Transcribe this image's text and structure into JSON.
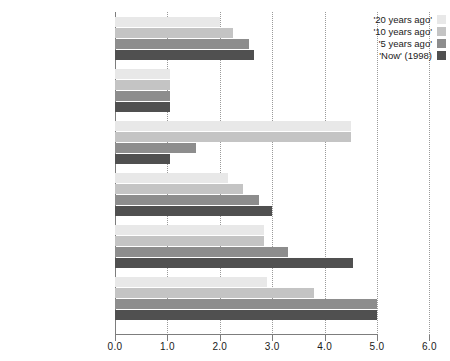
{
  "chart_data": {
    "type": "bar",
    "orientation": "horizontal",
    "title": "",
    "xlabel": "",
    "ylabel": "",
    "xlim": [
      0.0,
      6.0
    ],
    "xticks": [
      "0.0",
      "1.0",
      "2.0",
      "3.0",
      "4.0",
      "5.0",
      "6.0"
    ],
    "xtick_values": [
      0,
      1,
      2,
      3,
      4,
      5,
      6
    ],
    "grid": true,
    "legend_position": "top-right",
    "categories": [
      "Africa (20)",
      "Botswana / Mauritius /\nNamibia / Tunisia",
      "Eritrea",
      "Uganda",
      "Nigeria",
      "Kenya"
    ],
    "series": [
      {
        "name": "'20 years ago'",
        "color": "#e8e8e8",
        "values": [
          2.0,
          1.05,
          4.5,
          2.15,
          2.85,
          2.9
        ]
      },
      {
        "name": "'10 years ago'",
        "color": "#c4c4c4",
        "values": [
          2.25,
          1.05,
          4.5,
          2.45,
          2.85,
          3.8
        ]
      },
      {
        "name": "'5 years ago'",
        "color": "#8d8d8d",
        "values": [
          2.55,
          1.05,
          1.55,
          2.75,
          3.3,
          5.0
        ]
      },
      {
        "name": "'Now' (1998)",
        "color": "#505050",
        "values": [
          2.65,
          1.05,
          1.05,
          3.0,
          4.55,
          5.0
        ]
      }
    ]
  },
  "legend": {
    "items": [
      {
        "label": "'20 years ago'",
        "color": "#e8e8e8"
      },
      {
        "label": "'10 years ago'",
        "color": "#c4c4c4"
      },
      {
        "label": "'5 years ago'",
        "color": "#8d8d8d"
      },
      {
        "label": "'Now' (1998)",
        "color": "#505050"
      }
    ]
  },
  "axis": {
    "grid_color": "#9a9a9a",
    "line_color": "#7d7d7d"
  }
}
